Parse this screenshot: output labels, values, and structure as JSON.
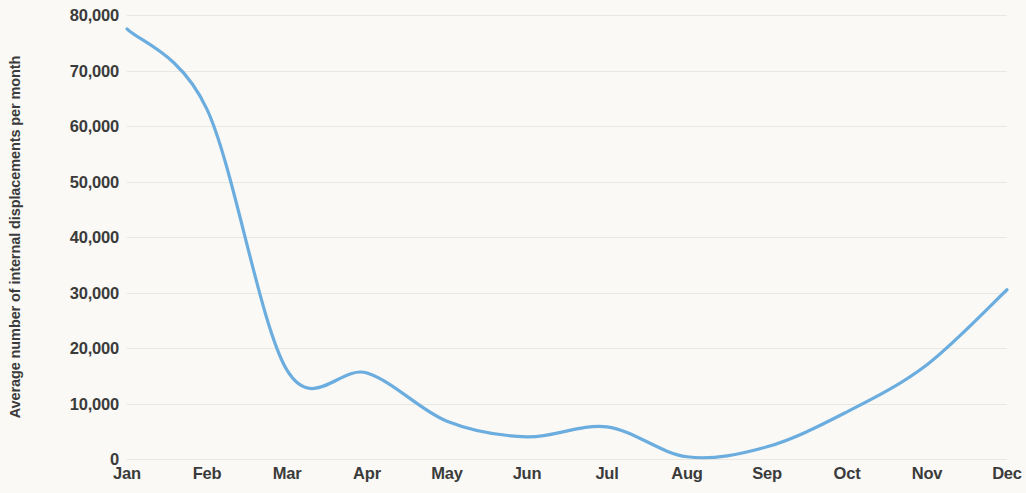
{
  "chart_data": {
    "type": "line",
    "title": "",
    "xlabel": "",
    "ylabel": "Average number of internal displacements per month",
    "categories": [
      "Jan",
      "Feb",
      "Mar",
      "Apr",
      "May",
      "Jun",
      "Jul",
      "Aug",
      "Sep",
      "Oct",
      "Nov",
      "Dec"
    ],
    "values": [
      77500,
      63000,
      16000,
      15500,
      6800,
      4000,
      5800,
      400,
      2200,
      8500,
      17000,
      30500
    ],
    "series": [
      {
        "name": "Average number of internal displacements per month",
        "values": [
          77500,
          63000,
          16000,
          15500,
          6800,
          4000,
          5800,
          400,
          2200,
          8500,
          17000,
          30500
        ],
        "color": "#6badde"
      }
    ],
    "ylim": [
      0,
      80000
    ],
    "ytick_values": [
      0,
      10000,
      20000,
      30000,
      40000,
      50000,
      60000,
      70000,
      80000
    ],
    "ytick_labels": [
      "0",
      "10,000",
      "20,000",
      "30,000",
      "40,000",
      "50,000",
      "60,000",
      "70,000",
      "80,000"
    ],
    "grid": true,
    "grid_axis": "y",
    "legend": false,
    "legend_position": "none",
    "smoothing": "spline"
  },
  "colors": {
    "line": "#6badde",
    "background": "#faf9f6",
    "gridline": "#e9e7e2",
    "text": "#3b3b3b"
  }
}
